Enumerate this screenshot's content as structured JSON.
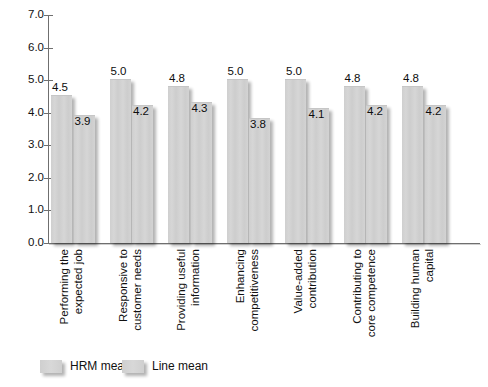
{
  "chart_data": {
    "type": "bar",
    "title": "",
    "subtitle": "",
    "xlabel": "",
    "ylabel": "",
    "ylim": [
      0.0,
      7.0
    ],
    "ytick_step": 1.0,
    "ytick_labels": [
      "7.0",
      "6.0",
      "5.0",
      "4.0",
      "3.0",
      "2.0",
      "1.0",
      "0.0"
    ],
    "ytick_values": [
      7.0,
      6.0,
      5.0,
      4.0,
      3.0,
      2.0,
      1.0,
      0.0
    ],
    "grid": false,
    "legend_position": "bottom-left",
    "categories": [
      "Performing the expected job",
      "Responsive to customer needs",
      "Providing useful information",
      "Enhancing competitiveness",
      "Value-added contribution",
      "Contributing to core competence",
      "Building human capital"
    ],
    "category_lines": [
      [
        "Performing the",
        "expected job"
      ],
      [
        "Responsive to",
        "customer needs"
      ],
      [
        "Providing useful",
        "information"
      ],
      [
        "Enhancing",
        "competitiveness"
      ],
      [
        "Value-added",
        "contribution"
      ],
      [
        "Contributing to",
        "core competence"
      ],
      [
        "Building human",
        "capital"
      ]
    ],
    "series": [
      {
        "name": "HRM mean",
        "color": "#d2d2d2",
        "values": [
          4.5,
          5.0,
          4.8,
          5.0,
          5.0,
          4.8,
          4.8
        ],
        "value_labels": [
          "4.5",
          "5.0",
          "4.8",
          "5.0",
          "5.0",
          "4.8",
          "4.8"
        ]
      },
      {
        "name": "Line mean",
        "color": "#d2d2d2",
        "values": [
          3.9,
          4.2,
          4.3,
          3.8,
          4.1,
          4.2,
          4.2
        ],
        "value_labels": [
          "3.9",
          "4.2",
          "4.3",
          "3.8",
          "4.1",
          "4.2",
          "4.2"
        ]
      }
    ]
  },
  "legend": {
    "items": [
      {
        "label": "HRM mean",
        "swatch_name": "hrm-mean-swatch"
      },
      {
        "label": "Line mean",
        "swatch_name": "line-mean-swatch"
      }
    ]
  },
  "colors": {
    "bar_fill": "#d2d2d2",
    "axis": "#6f6f6f",
    "text": "#111111",
    "background": "#ffffff"
  }
}
